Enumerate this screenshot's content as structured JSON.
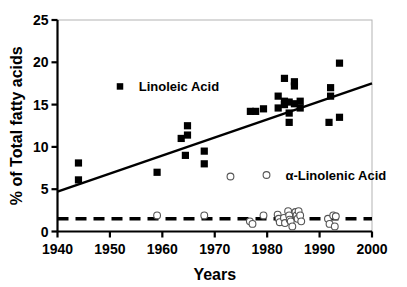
{
  "chart_data": {
    "type": "scatter",
    "title": "",
    "xlabel": "Years",
    "ylabel": "% of Total fatty acids",
    "xlim": [
      1940,
      2000
    ],
    "ylim": [
      0,
      25
    ],
    "xticks": [
      1940,
      1950,
      1960,
      1970,
      1980,
      1990,
      2000
    ],
    "yticks": [
      0,
      5,
      10,
      15,
      20,
      25
    ],
    "xtick_labels": [
      "1940",
      "1950",
      "1960",
      "1970",
      "1980",
      "1990",
      "2000"
    ],
    "ytick_labels": [
      "0",
      "5",
      "10",
      "15",
      "20",
      "25"
    ],
    "grid": false,
    "legend_position": "inside",
    "background_color": "#ffffff",
    "frame_color": "#b3b3b3",
    "series": [
      {
        "name": "Linoleic Acid",
        "marker": "filled-square",
        "color": "#000000",
        "legend_label": "Linoleic Acid",
        "legend_x": 1955.5,
        "legend_y": 17.0,
        "points": [
          {
            "x": 1944,
            "y": 8.1
          },
          {
            "x": 1944,
            "y": 6.1
          },
          {
            "x": 1959,
            "y": 7.0
          },
          {
            "x": 1963.6,
            "y": 11.0
          },
          {
            "x": 1964.8,
            "y": 12.5
          },
          {
            "x": 1964.8,
            "y": 11.4
          },
          {
            "x": 1964.4,
            "y": 9.0
          },
          {
            "x": 1968,
            "y": 9.5
          },
          {
            "x": 1968,
            "y": 8.0
          },
          {
            "x": 1976.8,
            "y": 14.2
          },
          {
            "x": 1977.8,
            "y": 14.2
          },
          {
            "x": 1979.3,
            "y": 14.5
          },
          {
            "x": 1982.1,
            "y": 16.0
          },
          {
            "x": 1982.1,
            "y": 14.6
          },
          {
            "x": 1983.3,
            "y": 18.1
          },
          {
            "x": 1983.3,
            "y": 15.4
          },
          {
            "x": 1983.3,
            "y": 15.0
          },
          {
            "x": 1984.2,
            "y": 15.3
          },
          {
            "x": 1984.2,
            "y": 14.0
          },
          {
            "x": 1984.2,
            "y": 12.9
          },
          {
            "x": 1985.2,
            "y": 17.7
          },
          {
            "x": 1985.2,
            "y": 17.2
          },
          {
            "x": 1985.2,
            "y": 15.1
          },
          {
            "x": 1986.3,
            "y": 15.4
          },
          {
            "x": 1986.3,
            "y": 14.6
          },
          {
            "x": 1992.1,
            "y": 16.0
          },
          {
            "x": 1992.1,
            "y": 17.0
          },
          {
            "x": 1991.8,
            "y": 12.9
          },
          {
            "x": 1993.8,
            "y": 19.9
          },
          {
            "x": 1993.8,
            "y": 13.5
          }
        ],
        "trendline": {
          "x1": 1940,
          "y1": 4.7,
          "x2": 2000,
          "y2": 17.5,
          "style": "solid",
          "color": "#000000"
        }
      },
      {
        "name": "alpha-Linolenic Acid",
        "marker": "open-circle",
        "color": "#555555",
        "legend_label": "α-Linolenic Acid",
        "legend_x": 1983.5,
        "legend_y": 6.5,
        "points": [
          {
            "x": 1959,
            "y": 1.9
          },
          {
            "x": 1968,
            "y": 1.9
          },
          {
            "x": 1973,
            "y": 6.5
          },
          {
            "x": 1976.7,
            "y": 1.2
          },
          {
            "x": 1977.2,
            "y": 0.9
          },
          {
            "x": 1979.3,
            "y": 1.9
          },
          {
            "x": 1982.0,
            "y": 2.0
          },
          {
            "x": 1982.2,
            "y": 1.5
          },
          {
            "x": 1982.4,
            "y": 1.1
          },
          {
            "x": 1983.2,
            "y": 1.6
          },
          {
            "x": 1983.4,
            "y": 1.0
          },
          {
            "x": 1984.0,
            "y": 2.4
          },
          {
            "x": 1984.2,
            "y": 1.9
          },
          {
            "x": 1984.3,
            "y": 1.4
          },
          {
            "x": 1984.5,
            "y": 1.2
          },
          {
            "x": 1984.8,
            "y": 0.6
          },
          {
            "x": 1985.4,
            "y": 2.3
          },
          {
            "x": 1985.6,
            "y": 1.9
          },
          {
            "x": 1985.8,
            "y": 1.5
          },
          {
            "x": 1986.0,
            "y": 2.4
          },
          {
            "x": 1986.3,
            "y": 1.9
          },
          {
            "x": 1986.5,
            "y": 1.2
          },
          {
            "x": 1991.6,
            "y": 1.5
          },
          {
            "x": 1991.9,
            "y": 0.9
          },
          {
            "x": 1992.6,
            "y": 1.9
          },
          {
            "x": 1993.1,
            "y": 1.8
          },
          {
            "x": 1992.9,
            "y": 0.6
          }
        ],
        "trendline": {
          "x1": 1940,
          "y1": 1.5,
          "x2": 2000,
          "y2": 1.5,
          "style": "dashed",
          "color": "#000000"
        }
      }
    ]
  }
}
